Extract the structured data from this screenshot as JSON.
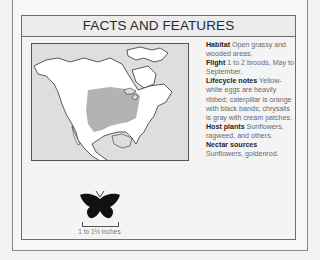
{
  "panel": {
    "title": "FACTS AND FEATURES"
  },
  "map": {
    "description": "Range map of North America",
    "range_color": "#b3b3b3",
    "land_color": "#ffffff",
    "water_color": "#dedede"
  },
  "facts": [
    {
      "label": "Habitat",
      "text": "Open grassy and wooded areas."
    },
    {
      "label": "Flight",
      "text": "1 to 2 broods, May to September."
    },
    {
      "label": "Lifecycle notes",
      "text": "Yellow-white eggs are heavily ribbed; caterpillar is orange with black bands; chrysalis is gray with cream patches."
    },
    {
      "label": "Host plants",
      "text": "Sunflowers, ragweed, and others."
    },
    {
      "label": "Nectar sources",
      "text": "Sunflowers, goldenrod."
    }
  ],
  "size": {
    "label": "1 to 1½ inches",
    "icon": "butterfly-silhouette-icon"
  }
}
